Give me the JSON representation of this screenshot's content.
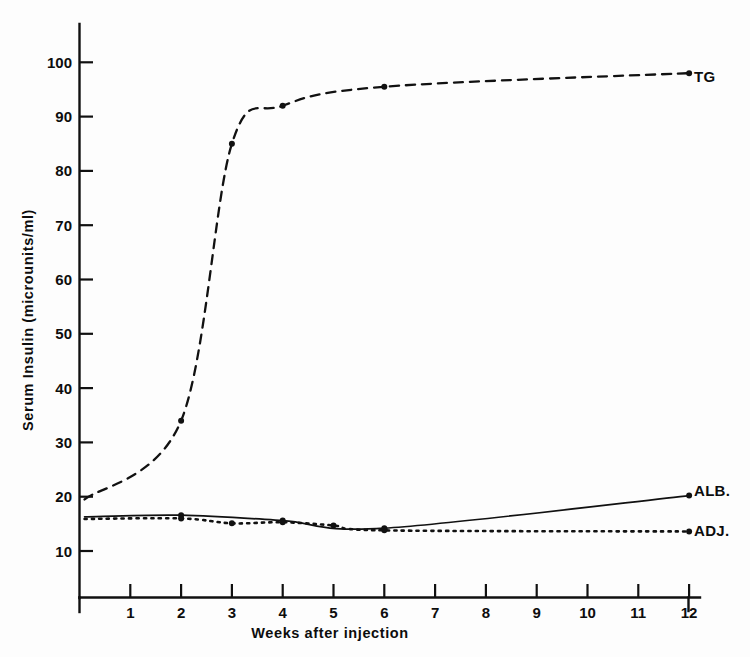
{
  "chart_data": {
    "type": "line",
    "title": "",
    "xlabel": "Weeks after injection",
    "ylabel": "Serum Insulin (microunits/ml)",
    "xlim": [
      0,
      12.5
    ],
    "ylim": [
      0,
      107
    ],
    "xticks": [
      1,
      2,
      3,
      4,
      5,
      6,
      7,
      8,
      9,
      10,
      11,
      12
    ],
    "yticks": [
      10,
      20,
      30,
      40,
      50,
      60,
      70,
      80,
      90,
      100
    ],
    "grid": false,
    "legend_position": "right-inline",
    "series": [
      {
        "name": "TG",
        "label": "TG",
        "style": "dashed",
        "color": "#111111",
        "x": [
          0.1,
          2,
          3,
          4,
          6,
          12
        ],
        "values": [
          19.5,
          34,
          85,
          92,
          95.5,
          98
        ],
        "marker_x": [
          2,
          3,
          4,
          6,
          12
        ],
        "marker_values": [
          34,
          85,
          92,
          95.5,
          98
        ]
      },
      {
        "name": "ALB.",
        "label": "ALB.",
        "style": "solid",
        "color": "#111111",
        "x": [
          0.1,
          2,
          4,
          6,
          12
        ],
        "values": [
          16.3,
          16.6,
          15.6,
          14.2,
          20.2
        ],
        "marker_x": [
          2,
          4,
          6,
          12
        ],
        "marker_values": [
          16.6,
          15.6,
          14.2,
          20.2
        ]
      },
      {
        "name": "ADJ.",
        "label": "ADJ.",
        "style": "dotted",
        "color": "#111111",
        "x": [
          0.1,
          2,
          3,
          4,
          5,
          6,
          12
        ],
        "values": [
          15.9,
          16.0,
          15.1,
          15.3,
          14.7,
          13.8,
          13.6
        ],
        "marker_x": [
          2,
          3,
          4,
          5,
          6,
          12
        ],
        "marker_values": [
          16.0,
          15.1,
          15.3,
          14.7,
          13.8,
          13.6
        ]
      }
    ]
  },
  "axes": {
    "x_title": "Weeks after injection",
    "y_title": "Serum Insulin (microunits/ml)",
    "x_tick_labels": [
      "1",
      "2",
      "3",
      "4",
      "5",
      "6",
      "7",
      "8",
      "9",
      "10",
      "11",
      "12"
    ],
    "y_tick_labels": [
      "10",
      "20",
      "30",
      "40",
      "50",
      "60",
      "70",
      "80",
      "90",
      "100"
    ]
  },
  "series_labels": {
    "tg": "TG",
    "alb": "ALB.",
    "adj": "ADJ."
  },
  "colors": {
    "ink": "#111111",
    "background": "#fdfdfd"
  }
}
